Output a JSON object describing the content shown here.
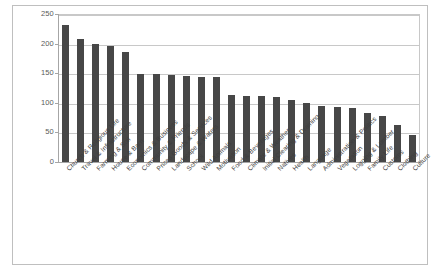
{
  "chart_data": {
    "type": "bar",
    "title": "",
    "subtitle": "",
    "xlabel": "",
    "ylabel": "",
    "ylim": [
      0,
      250
    ],
    "y_ticks": [
      0,
      50,
      100,
      150,
      200,
      250
    ],
    "grid": true,
    "legend": null,
    "bar_color": "#474747",
    "categories": [
      "Church & Religious Life",
      "Travel & Infrastructure",
      "Farming & Soil",
      "House & Barn",
      "Economics & Business",
      "Community & Friends",
      "Prices Goods & Services",
      "Landscape & Waters",
      "School",
      "Wild Animals",
      "Motivation",
      "Food & Beverages",
      "Climate & Weather",
      "Initial Clearing & Draining",
      "Natives",
      "Health",
      "Language",
      "Administration & Politics",
      "Vegetation",
      "Logging & Lumber",
      "Family Life",
      "Customs",
      "Clothing",
      "Culture"
    ],
    "values": [
      232,
      207,
      199,
      196,
      185,
      149,
      149,
      147,
      146,
      144,
      143,
      113,
      112,
      111,
      110,
      104,
      99,
      94,
      93,
      92,
      82,
      78,
      62,
      45
    ]
  }
}
